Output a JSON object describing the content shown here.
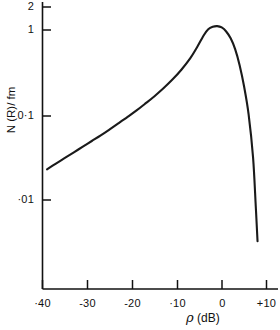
{
  "chart_data": {
    "type": "line",
    "title": "",
    "xlabel": "ρ (dB)",
    "ylabel": "N (R)/ fm",
    "xscale": "linear",
    "yscale": "log",
    "xlim": [
      -40,
      10
    ],
    "ylim": [
      0.003,
      2
    ],
    "grid": false,
    "legend": null,
    "x_ticks": [
      -40,
      -30,
      -20,
      -10,
      0,
      10
    ],
    "x_tick_labels": [
      "·40",
      "-30",
      "-20",
      "·10",
      "0",
      "+10"
    ],
    "y_ticks": [
      2,
      1,
      0.1,
      0.01
    ],
    "y_tick_labels": [
      "2",
      "1",
      "0·1",
      "·01"
    ],
    "series": [
      {
        "name": "N(R)",
        "x": [
          -39.0,
          -37.0,
          -35.0,
          -33.0,
          -31.0,
          -29.0,
          -27.0,
          -25.0,
          -23.0,
          -21.0,
          -19.0,
          -17.0,
          -15.0,
          -13.0,
          -11.0,
          -9.0,
          -7.0,
          -5.5,
          -4.0,
          -3.0,
          -2.0,
          -1.0,
          0.0,
          1.0,
          2.0,
          3.0,
          4.0,
          5.0,
          6.0,
          7.0,
          7.6,
          8.0
        ],
        "y": [
          0.024,
          0.028,
          0.0325,
          0.0378,
          0.044,
          0.0512,
          0.0596,
          0.07,
          0.0825,
          0.0975,
          0.116,
          0.14,
          0.17,
          0.21,
          0.265,
          0.345,
          0.47,
          0.63,
          0.87,
          1.02,
          1.09,
          1.11,
          1.07,
          0.96,
          0.8,
          0.6,
          0.39,
          0.22,
          0.105,
          0.033,
          0.009,
          0.0035
        ]
      }
    ]
  },
  "axes": {
    "y_axis_title": "N (R)/ fm",
    "x_axis_title_symbol": "ρ",
    "x_axis_title_unit": "(dB)"
  }
}
